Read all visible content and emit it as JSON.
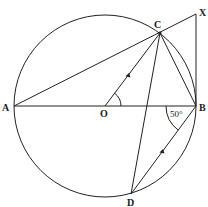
{
  "diagram": {
    "type": "circle-geometry",
    "stroke_color": "#222222",
    "background": "#ffffff",
    "circle": {
      "center": "O",
      "diameter": "AB"
    },
    "points": {
      "A": {
        "label": "A",
        "x": 14,
        "y": 106
      },
      "B": {
        "label": "B",
        "x": 196,
        "y": 106
      },
      "C": {
        "label": "C",
        "x": 160,
        "y": 33
      },
      "D": {
        "label": "D",
        "x": 131,
        "y": 194
      },
      "O": {
        "label": "O",
        "x": 105,
        "y": 106
      },
      "X": {
        "label": "X",
        "x": 196,
        "y": 14
      }
    },
    "segments": [
      "AB",
      "AX",
      "OC",
      "CB",
      "CD",
      "DB",
      "BX"
    ],
    "parallel_marks": [
      "OC",
      "DB"
    ],
    "angles": {
      "COB": {
        "vertex": "O",
        "label": ""
      },
      "ABD": {
        "vertex": "B",
        "label": "50°"
      }
    }
  }
}
